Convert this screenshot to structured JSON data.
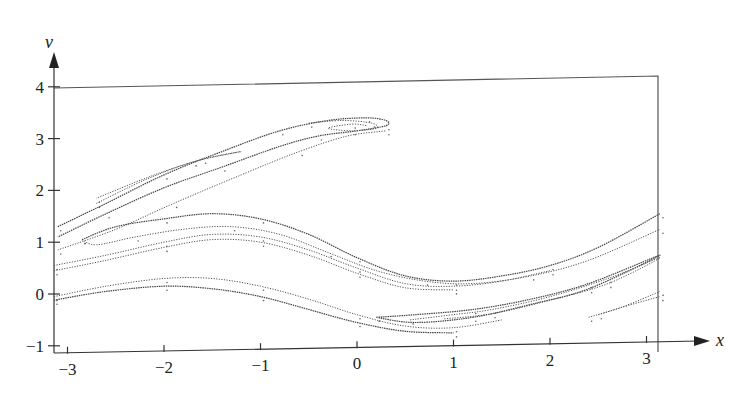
{
  "chart_data": {
    "type": "scatter",
    "title": "",
    "xlabel": "x",
    "ylabel": "v",
    "xlim": [
      -3.14,
      3.14
    ],
    "ylim": [
      -1,
      4
    ],
    "grid": false,
    "legend": null,
    "x_ticks": [
      -3,
      -2,
      -1,
      0,
      1,
      2,
      3
    ],
    "x_tick_labels": [
      "−3",
      "−2",
      "−1",
      "0",
      "1",
      "2",
      "3"
    ],
    "y_ticks": [
      -1,
      0,
      1,
      2,
      3,
      4
    ],
    "y_tick_labels": [
      "−1",
      "0",
      "1",
      "2",
      "3",
      "4"
    ],
    "series": [
      {
        "name": "upper-lobe-outer",
        "points": [
          [
            -3.1,
            1.3
          ],
          [
            -2.6,
            1.75
          ],
          [
            -2.0,
            2.3
          ],
          [
            -1.4,
            2.75
          ],
          [
            -0.8,
            3.15
          ],
          [
            -0.3,
            3.35
          ],
          [
            0.1,
            3.4
          ],
          [
            0.3,
            3.35
          ],
          [
            0.3,
            3.25
          ],
          [
            0.0,
            3.15
          ],
          [
            -0.4,
            3.05
          ],
          [
            -0.8,
            2.85
          ],
          [
            -1.4,
            2.45
          ],
          [
            -2.0,
            2.05
          ],
          [
            -2.6,
            1.55
          ],
          [
            -3.1,
            1.1
          ]
        ]
      },
      {
        "name": "upper-lobe-inner",
        "points": [
          [
            -2.7,
            1.75
          ],
          [
            -2.2,
            2.2
          ],
          [
            -1.7,
            2.55
          ],
          [
            -1.2,
            2.75
          ],
          [
            -1.6,
            2.6
          ],
          [
            -2.1,
            2.3
          ],
          [
            -2.7,
            1.85
          ]
        ]
      },
      {
        "name": "upper-lobe-tip",
        "points": [
          [
            -0.5,
            3.3
          ],
          [
            -0.15,
            3.35
          ],
          [
            0.15,
            3.3
          ],
          [
            0.2,
            3.2
          ],
          [
            -0.05,
            3.15
          ],
          [
            -0.3,
            3.2
          ],
          [
            -0.05,
            3.28
          ],
          [
            0.1,
            3.25
          ]
        ]
      },
      {
        "name": "upper-lobe-lower",
        "points": [
          [
            -3.1,
            0.85
          ],
          [
            -2.5,
            1.25
          ],
          [
            -1.9,
            1.75
          ],
          [
            -1.2,
            2.3
          ],
          [
            -0.6,
            2.75
          ],
          [
            -0.1,
            3.05
          ],
          [
            0.3,
            3.15
          ]
        ]
      },
      {
        "name": "mid-band-outer",
        "points": [
          [
            -2.85,
            1.05
          ],
          [
            -2.5,
            1.3
          ],
          [
            -2.0,
            1.45
          ],
          [
            -1.5,
            1.55
          ],
          [
            -1.0,
            1.45
          ],
          [
            -0.5,
            1.15
          ],
          [
            0.0,
            0.7
          ],
          [
            0.5,
            0.35
          ],
          [
            1.0,
            0.25
          ],
          [
            1.5,
            0.35
          ],
          [
            2.0,
            0.55
          ],
          [
            2.5,
            0.9
          ],
          [
            3.14,
            1.55
          ]
        ]
      },
      {
        "name": "mid-band-hook",
        "points": [
          [
            -2.85,
            1.05
          ],
          [
            -2.7,
            0.95
          ],
          [
            -2.3,
            1.1
          ],
          [
            -1.8,
            1.25
          ],
          [
            -1.3,
            1.3
          ],
          [
            -0.8,
            1.15
          ],
          [
            -0.3,
            0.8
          ],
          [
            0.2,
            0.45
          ],
          [
            0.7,
            0.25
          ],
          [
            1.2,
            0.2
          ],
          [
            1.8,
            0.35
          ],
          [
            2.4,
            0.65
          ],
          [
            3.14,
            1.25
          ]
        ]
      },
      {
        "name": "mid-band-lower",
        "points": [
          [
            -3.14,
            0.55
          ],
          [
            -2.6,
            0.75
          ],
          [
            -2.0,
            1.0
          ],
          [
            -1.5,
            1.15
          ],
          [
            -1.0,
            1.1
          ],
          [
            -0.5,
            0.85
          ],
          [
            0.0,
            0.5
          ],
          [
            0.5,
            0.2
          ],
          [
            1.0,
            0.15
          ],
          [
            1.5,
            0.25
          ],
          [
            2.0,
            0.45
          ]
        ]
      },
      {
        "name": "mid-band-lowest",
        "points": [
          [
            -3.14,
            0.45
          ],
          [
            -2.6,
            0.65
          ],
          [
            -2.0,
            0.9
          ],
          [
            -1.5,
            1.05
          ],
          [
            -1.0,
            1.0
          ],
          [
            -0.5,
            0.75
          ],
          [
            0.0,
            0.4
          ],
          [
            0.5,
            0.12
          ],
          [
            1.0,
            0.08
          ]
        ]
      },
      {
        "name": "low-band-upper",
        "points": [
          [
            -3.14,
            -0.05
          ],
          [
            -2.6,
            0.15
          ],
          [
            -2.0,
            0.3
          ],
          [
            -1.5,
            0.3
          ],
          [
            -1.0,
            0.15
          ],
          [
            -0.5,
            -0.1
          ],
          [
            0.0,
            -0.4
          ],
          [
            0.5,
            -0.62
          ],
          [
            1.0,
            -0.65
          ],
          [
            1.5,
            -0.5
          ]
        ]
      },
      {
        "name": "low-band-lower",
        "points": [
          [
            -3.14,
            -0.12
          ],
          [
            -2.6,
            0.05
          ],
          [
            -2.0,
            0.15
          ],
          [
            -1.5,
            0.1
          ],
          [
            -1.0,
            -0.05
          ],
          [
            -0.5,
            -0.3
          ],
          [
            0.0,
            -0.55
          ],
          [
            0.5,
            -0.72
          ],
          [
            1.0,
            -0.75
          ]
        ]
      },
      {
        "name": "right-hook-outer",
        "points": [
          [
            0.2,
            -0.45
          ],
          [
            0.6,
            -0.4
          ],
          [
            1.2,
            -0.3
          ],
          [
            1.8,
            -0.1
          ],
          [
            2.4,
            0.2
          ],
          [
            3.14,
            0.75
          ],
          [
            2.4,
            0.1
          ],
          [
            1.8,
            -0.2
          ],
          [
            1.2,
            -0.45
          ],
          [
            0.6,
            -0.55
          ],
          [
            0.2,
            -0.45
          ]
        ]
      },
      {
        "name": "right-hook-inner",
        "points": [
          [
            0.55,
            -0.5
          ],
          [
            0.9,
            -0.42
          ],
          [
            1.4,
            -0.3
          ],
          [
            2.0,
            -0.05
          ],
          [
            2.6,
            0.3
          ],
          [
            3.14,
            0.7
          ],
          [
            2.6,
            0.2
          ],
          [
            2.0,
            -0.12
          ],
          [
            1.4,
            -0.38
          ],
          [
            0.9,
            -0.48
          ]
        ]
      },
      {
        "name": "right-tendril",
        "points": [
          [
            2.4,
            -0.45
          ],
          [
            2.75,
            -0.25
          ],
          [
            3.14,
            0.05
          ]
        ]
      },
      {
        "name": "right-tendril-2",
        "points": [
          [
            2.5,
            -0.4
          ],
          [
            2.85,
            -0.2
          ],
          [
            3.14,
            -0.05
          ]
        ]
      }
    ]
  }
}
